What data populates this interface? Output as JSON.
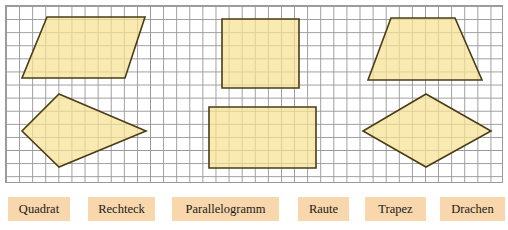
{
  "worksheet": {
    "title": "Vierecke Zuordnung",
    "grid": {
      "cell_size_px": 13,
      "line_color": "#9a9a9a",
      "background_color": "#ffffff",
      "visible": true
    },
    "shape_style": {
      "fill_color": "#f7e294",
      "stroke_color": "#4a3d16"
    },
    "shapes": [
      {
        "name": "parallelogram",
        "label": "Parallelogramm",
        "points": "47,17 145,17 125,78 22,78"
      },
      {
        "name": "kite",
        "label": "Drachen",
        "points": "59,94 146,131 59,167 22,131"
      },
      {
        "name": "square",
        "label": "Quadrat",
        "points": "222,19 299,19 299,88 222,88"
      },
      {
        "name": "rectangle",
        "label": "Rechteck",
        "points": "209,107 316,107 316,168 209,168"
      },
      {
        "name": "trapezoid",
        "label": "Trapez",
        "points": "391,18 455,18 482,80 368,80"
      },
      {
        "name": "rhombus",
        "label": "Raute",
        "points": "426,94 491,131 426,167 363,131"
      }
    ]
  },
  "labels": {
    "chip_background": "#f7d7ab",
    "items": [
      {
        "name": "quadrat",
        "text": "Quadrat",
        "left": 8,
        "width": 62
      },
      {
        "name": "rechteck",
        "text": "Rechteck",
        "left": 88,
        "width": 67
      },
      {
        "name": "parallelogramm",
        "text": "Parallelogramm",
        "left": 172,
        "width": 107
      },
      {
        "name": "raute",
        "text": "Raute",
        "left": 298,
        "width": 51
      },
      {
        "name": "trapez",
        "text": "Trapez",
        "left": 365,
        "width": 61
      },
      {
        "name": "drachen",
        "text": "Drachen",
        "left": 440,
        "width": 65
      }
    ]
  }
}
